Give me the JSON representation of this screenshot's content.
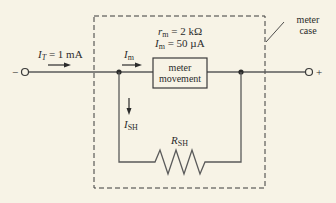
{
  "diagram": {
    "source_current": {
      "symbol": "I",
      "subscript": "T",
      "value_text": "= 1 mA"
    },
    "meter_current_label": {
      "symbol": "I",
      "subscript": "m"
    },
    "meter_params": {
      "resistance": {
        "symbol": "r",
        "subscript": "m",
        "value_text": "= 2 kΩ"
      },
      "current": {
        "symbol": "I",
        "subscript": "m",
        "value_text": "= 50 µA"
      }
    },
    "meter_box": {
      "line1": "meter",
      "line2": "movement"
    },
    "shunt_current": {
      "symbol": "I",
      "subscript": "SH"
    },
    "shunt_resistor": {
      "symbol": "R",
      "subscript": "SH"
    },
    "terminals": {
      "negative": "−",
      "positive": "+"
    },
    "case_label": {
      "line1": "meter",
      "line2": "case"
    },
    "colors": {
      "background": "#f7f3e6",
      "wire": "#5a5a5a",
      "ink": "#2b2b2b"
    }
  }
}
